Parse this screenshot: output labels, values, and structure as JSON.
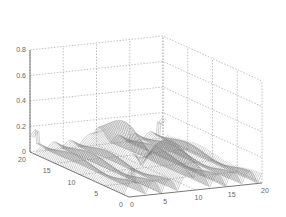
{
  "chart_data": {
    "type": "surface",
    "title": "",
    "xlabel": "",
    "ylabel": "",
    "zlabel": "",
    "x_ticks": [
      "0",
      "5",
      "10",
      "15",
      "20"
    ],
    "y_ticks": [
      "0",
      "5",
      "10",
      "15",
      "20"
    ],
    "z_ticks": [
      "0",
      "0.2",
      "0.4",
      "0.6",
      "0.8"
    ],
    "xlim": [
      0,
      20
    ],
    "ylim": [
      0,
      20
    ],
    "zlim": [
      0,
      0.8
    ],
    "grid": true,
    "peak": {
      "x": 10,
      "y": 10,
      "z": 0.6
    },
    "colors": {
      "mesh": "#777777",
      "grid": "#999999",
      "axis": "#555555"
    }
  }
}
